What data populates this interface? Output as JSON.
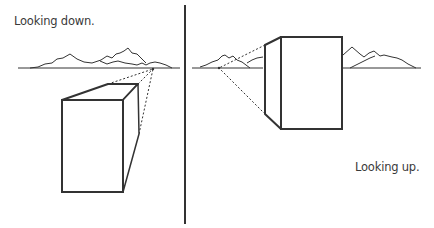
{
  "figure": {
    "left_panel": {
      "caption": "Looking down.",
      "vanishing_point": [
        153,
        69
      ],
      "horizon_y": 68
    },
    "right_panel": {
      "caption": "Looking up.",
      "vanishing_point": [
        219,
        68
      ],
      "horizon_y": 68
    },
    "colors": {
      "ink": "#333333",
      "background": "#ffffff"
    }
  }
}
